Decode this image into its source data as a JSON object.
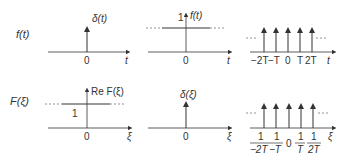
{
  "rows": [
    {
      "label": "f(t)",
      "panels": [
        {
          "name": "delta",
          "annotation": "δ(t)",
          "origin": "0",
          "axis": "t"
        },
        {
          "name": "constant",
          "annotation": "f(t)",
          "level": "1",
          "origin": "0",
          "axis": "t"
        },
        {
          "name": "comb",
          "ticks": [
            "−2T",
            "−T",
            "0",
            "T",
            "2T"
          ],
          "axis": "t"
        }
      ]
    },
    {
      "label": "F(ξ)",
      "panels": [
        {
          "name": "constant",
          "annotation": "Re F(ξ)",
          "level": "1",
          "origin": "0",
          "axis": "ξ"
        },
        {
          "name": "delta",
          "annotation": "δ(ξ)",
          "origin": "0",
          "axis": "ξ"
        },
        {
          "name": "comb",
          "ticks": [
            {
              "num": "1",
              "den": "−2T"
            },
            {
              "num": "1",
              "den": "−T"
            },
            {
              "num": "0",
              "den": ""
            },
            {
              "num": "1",
              "den": "T"
            },
            {
              "num": "1",
              "den": "2T"
            }
          ],
          "axis": "ξ"
        }
      ]
    }
  ],
  "colors": {
    "stroke": "#333333",
    "dashed": "#777777"
  }
}
